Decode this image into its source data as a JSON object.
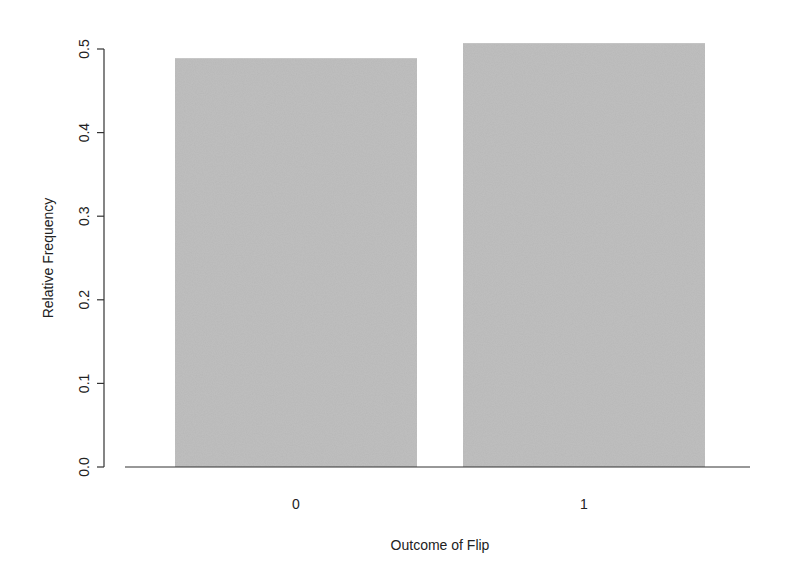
{
  "chart_data": {
    "type": "bar",
    "title": "",
    "xlabel": "Outcome of Flip",
    "ylabel": "Relative Frequency",
    "categories": [
      "0",
      "1"
    ],
    "values": [
      0.489,
      0.507
    ],
    "ylim": [
      0,
      0.5
    ],
    "yticks": [
      0.0,
      0.1,
      0.2,
      0.3,
      0.4,
      0.5
    ],
    "ytick_labels": [
      "0.0",
      "0.1",
      "0.2",
      "0.3",
      "0.4",
      "0.5"
    ],
    "grid": false,
    "legend": null,
    "bar_color": "#b8b8b8"
  }
}
